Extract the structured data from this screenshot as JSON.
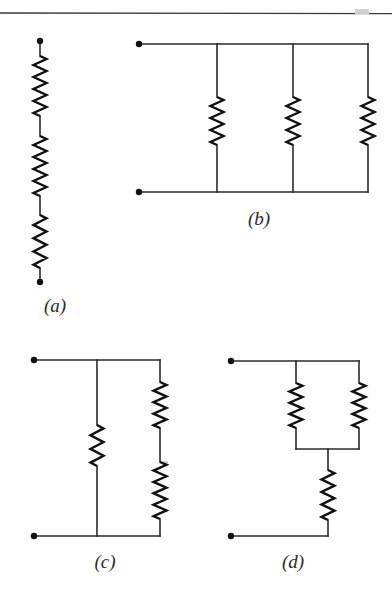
{
  "figure": {
    "kind": "circuit-diagram-figure",
    "background_color": "#fefefe",
    "wire_color": "#2a2a2a",
    "resistor_color": "#111111",
    "terminal_color": "#111111",
    "top_rule": {
      "name": "page-rule",
      "y": 13,
      "x_start": 0,
      "x_end": 392,
      "color": "#3a3a3a"
    },
    "captions": [
      {
        "id": "a",
        "label": "(a)",
        "x": 55,
        "y": 312
      },
      {
        "id": "b",
        "label": "(b)",
        "x": 259,
        "y": 225
      },
      {
        "id": "c",
        "label": "(c)",
        "x": 105,
        "y": 568
      },
      {
        "id": "d",
        "label": "(d)",
        "x": 293,
        "y": 568
      }
    ],
    "circuits": [
      {
        "id": "a",
        "name": "circuit-a",
        "description": "three resistors in series on a single vertical branch",
        "resistor_count": 3,
        "topology": "series",
        "terminals": [
          {
            "name": "terminal-a-top",
            "x": 40,
            "y": 41
          },
          {
            "name": "terminal-a-bottom",
            "x": 40,
            "y": 282
          }
        ],
        "resistors": [
          {
            "name": "resistor-a1",
            "orientation": "vertical",
            "x": 40,
            "y1": 56,
            "y2": 116
          },
          {
            "name": "resistor-a2",
            "orientation": "vertical",
            "x": 40,
            "y1": 136,
            "y2": 196
          },
          {
            "name": "resistor-a3",
            "orientation": "vertical",
            "x": 40,
            "y1": 215,
            "y2": 268
          }
        ],
        "wires": [
          {
            "name": "wire-a-top",
            "points": "40,41 40,56"
          },
          {
            "name": "wire-a-mid1",
            "points": "40,116 40,136"
          },
          {
            "name": "wire-a-mid2",
            "points": "40,196 40,215"
          },
          {
            "name": "wire-a-bottom",
            "points": "40,268 40,282"
          }
        ]
      },
      {
        "id": "b",
        "name": "circuit-b",
        "description": "three resistors in parallel between a top rail and a bottom rail",
        "resistor_count": 3,
        "topology": "parallel",
        "terminals": [
          {
            "name": "terminal-b-top-left",
            "x": 139,
            "y": 44
          },
          {
            "name": "terminal-b-bottom-left",
            "x": 139,
            "y": 192
          }
        ],
        "resistors": [
          {
            "name": "resistor-b1",
            "orientation": "vertical",
            "x": 217,
            "y1": 97,
            "y2": 145
          },
          {
            "name": "resistor-b2",
            "orientation": "vertical",
            "x": 293,
            "y1": 97,
            "y2": 145
          },
          {
            "name": "resistor-b3",
            "orientation": "vertical",
            "x": 368,
            "y1": 97,
            "y2": 145
          }
        ],
        "wires": [
          {
            "name": "wire-b-top-rail",
            "points": "139,44 368,44"
          },
          {
            "name": "wire-b-bottom-rail",
            "points": "139,192 368,192"
          },
          {
            "name": "wire-b-branch1-top",
            "points": "217,44 217,97"
          },
          {
            "name": "wire-b-branch1-bottom",
            "points": "217,145 217,192"
          },
          {
            "name": "wire-b-branch2-top",
            "points": "293,44 293,97"
          },
          {
            "name": "wire-b-branch2-bottom",
            "points": "293,145 293,192"
          },
          {
            "name": "wire-b-branch3-top",
            "points": "368,44 368,97"
          },
          {
            "name": "wire-b-branch3-bottom",
            "points": "368,145 368,192"
          }
        ]
      },
      {
        "id": "c",
        "name": "circuit-c",
        "description": "one resistor on the middle branch in parallel with two series resistors on the right branch",
        "resistor_count": 3,
        "topology": "mixed",
        "terminals": [
          {
            "name": "terminal-c-top-left",
            "x": 34,
            "y": 360
          },
          {
            "name": "terminal-c-bottom-left",
            "x": 34,
            "y": 536
          }
        ],
        "resistors": [
          {
            "name": "resistor-c-middle",
            "orientation": "vertical",
            "x": 97,
            "y1": 425,
            "y2": 466
          },
          {
            "name": "resistor-c-right-upper",
            "orientation": "vertical",
            "x": 160,
            "y1": 382,
            "y2": 428
          },
          {
            "name": "resistor-c-right-lower",
            "orientation": "vertical",
            "x": 160,
            "y1": 462,
            "y2": 519
          }
        ],
        "wires": [
          {
            "name": "wire-c-top-rail",
            "points": "34,360 160,360"
          },
          {
            "name": "wire-c-bottom-rail",
            "points": "34,536 160,536"
          },
          {
            "name": "wire-c-middle-top",
            "points": "97,360 97,425"
          },
          {
            "name": "wire-c-middle-bottom",
            "points": "97,466 97,536"
          },
          {
            "name": "wire-c-right-top",
            "points": "160,360 160,382"
          },
          {
            "name": "wire-c-right-mid",
            "points": "160,428 160,462"
          },
          {
            "name": "wire-c-right-bottom",
            "points": "160,519 160,536"
          }
        ]
      },
      {
        "id": "d",
        "name": "circuit-d",
        "description": "two parallel resistors in series with a third resistor below",
        "resistor_count": 3,
        "topology": "mixed",
        "terminals": [
          {
            "name": "terminal-d-top-left",
            "x": 231,
            "y": 361
          },
          {
            "name": "terminal-d-bottom-left",
            "x": 231,
            "y": 536
          }
        ],
        "resistors": [
          {
            "name": "resistor-d-left",
            "orientation": "vertical",
            "x": 296,
            "y1": 383,
            "y2": 428
          },
          {
            "name": "resistor-d-right",
            "orientation": "vertical",
            "x": 359,
            "y1": 383,
            "y2": 428
          },
          {
            "name": "resistor-d-series",
            "orientation": "vertical",
            "x": 328,
            "y1": 470,
            "y2": 520
          }
        ],
        "wires": [
          {
            "name": "wire-d-top-rail",
            "points": "231,361 359,361"
          },
          {
            "name": "wire-d-left-top",
            "points": "296,361 296,383"
          },
          {
            "name": "wire-d-right-top",
            "points": "359,361 359,383"
          },
          {
            "name": "wire-d-left-bottom",
            "points": "296,428 296,449"
          },
          {
            "name": "wire-d-right-bottom",
            "points": "359,428 359,449"
          },
          {
            "name": "wire-d-join-rail",
            "points": "296,449 359,449"
          },
          {
            "name": "wire-d-series-top",
            "points": "328,449 328,470"
          },
          {
            "name": "wire-d-series-bottom",
            "points": "328,520 328,536"
          },
          {
            "name": "wire-d-bottom-rail",
            "points": "231,536 328,536"
          }
        ]
      }
    ],
    "specks": [
      {
        "name": "scan-speck-1",
        "x": 355,
        "y": 9,
        "w": 14,
        "h": 5
      },
      {
        "name": "scan-speck-2",
        "x": 163,
        "y": 461,
        "w": 5,
        "h": 4
      }
    ]
  }
}
